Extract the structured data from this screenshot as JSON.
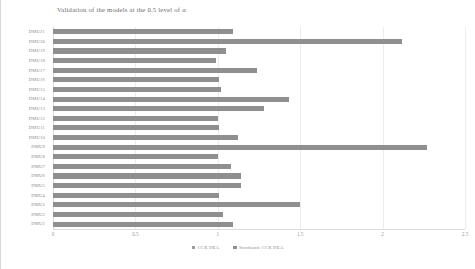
{
  "chart_data": {
    "type": "bar",
    "orientation": "horizontal",
    "title": "Validation of the models at the 0.5 level of α",
    "xlabel": "",
    "ylabel": "",
    "xlim": [
      0,
      2.5
    ],
    "xticks": [
      0,
      0.5,
      1,
      1.5,
      2,
      2.5
    ],
    "xtick_labels": [
      "0",
      "0.5",
      "1",
      "1.5",
      "2",
      "2.5"
    ],
    "grid": true,
    "legend_position": "bottom",
    "categories": [
      "DMU21",
      "DMU20",
      "DMU19",
      "DMU18",
      "DMU17",
      "DMU16",
      "DMU15",
      "DMU14",
      "DMU13",
      "DMU12",
      "DMU11",
      "DMU10",
      "DMU9",
      "DMU8",
      "DMU7",
      "DMU6",
      "DMU5",
      "DMU4",
      "DMU3",
      "DMU2",
      "DMU1"
    ],
    "series": [
      {
        "name": "CCR DEA",
        "color": "#9c9c9c",
        "values": [
          0,
          0,
          0,
          0,
          0,
          0,
          0,
          0,
          0,
          0,
          0,
          0,
          0,
          0,
          0,
          0,
          0,
          0,
          0,
          0,
          0
        ]
      },
      {
        "name": "Stochastic CCR DEA",
        "color": "#8f8f8f",
        "values": [
          1.09,
          2.12,
          1.05,
          0.99,
          1.24,
          1.01,
          1.02,
          1.43,
          1.28,
          1.0,
          1.01,
          1.12,
          2.27,
          1.0,
          1.08,
          1.14,
          1.14,
          1.01,
          1.5,
          1.03,
          1.09
        ]
      }
    ]
  },
  "legend": {
    "entries": [
      {
        "label": "CCR DEA"
      },
      {
        "label": "Stochastic CCR DEA"
      }
    ]
  },
  "colors": {
    "bar_primary": "#8f8f8f",
    "bar_secondary": "#9c9c9c",
    "gridline": "#ededed",
    "axis": "#dcdcdc",
    "text": "#8a8a8a",
    "title_text": "#6b6b6b",
    "background": "#ffffff"
  }
}
